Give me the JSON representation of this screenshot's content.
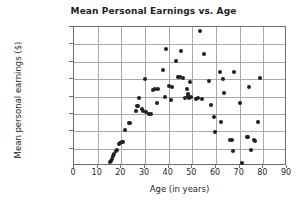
{
  "chart_data": {
    "type": "scatter",
    "title": "Mean Personal Earnings vs. Age",
    "xlabel": "Age (in years)",
    "ylabel": "Mean personal earnings ($)",
    "xlim": [
      0,
      90
    ],
    "ylim": [
      0,
      80000
    ],
    "xticks": [
      0,
      10,
      20,
      30,
      40,
      50,
      60,
      70,
      80,
      90
    ],
    "xtick_labels": [
      "0",
      "10",
      "20",
      "30",
      "40",
      "50",
      "60",
      "70",
      "80",
      "90"
    ],
    "yticks": [
      10000,
      20000,
      30000,
      40000,
      50000,
      60000,
      70000,
      80000
    ],
    "ytick_labels": [
      "10,000",
      "20,000",
      "30,000",
      "40,000",
      "50,000",
      "60,000",
      "70,000",
      "80,000"
    ],
    "grid": true,
    "legend": null,
    "marker_color": "#231f20",
    "gridline_color": "#a7a9ac",
    "axis_color": "#6d6e71",
    "points": [
      [
        15.5,
        1500
      ],
      [
        16.0,
        2200
      ],
      [
        16.5,
        3400
      ],
      [
        17.0,
        5200
      ],
      [
        17.5,
        6500
      ],
      [
        18.0,
        7800
      ],
      [
        18.5,
        8800
      ],
      [
        19.5,
        11800
      ],
      [
        20.0,
        12500
      ],
      [
        20.5,
        13400
      ],
      [
        21.0,
        13200
      ],
      [
        22.0,
        20100
      ],
      [
        23.5,
        24300
      ],
      [
        24.0,
        23900
      ],
      [
        26.5,
        31200
      ],
      [
        27.0,
        33800
      ],
      [
        27.5,
        34200
      ],
      [
        27.8,
        38300
      ],
      [
        29.0,
        32400
      ],
      [
        29.5,
        31300
      ],
      [
        30.5,
        49500
      ],
      [
        31.0,
        30600
      ],
      [
        32.0,
        29200
      ],
      [
        33.0,
        29300
      ],
      [
        34.0,
        43200
      ],
      [
        34.8,
        43600
      ],
      [
        35.5,
        35600
      ],
      [
        36.0,
        44000
      ],
      [
        38.0,
        54400
      ],
      [
        39.0,
        39400
      ],
      [
        39.5,
        66800
      ],
      [
        40.5,
        45200
      ],
      [
        41.5,
        37600
      ],
      [
        42.0,
        44700
      ],
      [
        43.5,
        59600
      ],
      [
        44.5,
        50700
      ],
      [
        45.0,
        50500
      ],
      [
        45.5,
        65700
      ],
      [
        46.5,
        50200
      ],
      [
        47.5,
        38700
      ],
      [
        48.0,
        43800
      ],
      [
        48.5,
        40700
      ],
      [
        48.8,
        39800
      ],
      [
        49.0,
        38500
      ],
      [
        49.5,
        47600
      ],
      [
        50.0,
        38900
      ],
      [
        52.0,
        38200
      ],
      [
        53.0,
        38300
      ],
      [
        53.5,
        77300
      ],
      [
        54.5,
        38000
      ],
      [
        55.5,
        63900
      ],
      [
        57.5,
        48300
      ],
      [
        58.5,
        34800
      ],
      [
        59.5,
        27700
      ],
      [
        60.0,
        19200
      ],
      [
        62.0,
        53400
      ],
      [
        62.5,
        24900
      ],
      [
        63.5,
        49700
      ],
      [
        64.0,
        41200
      ],
      [
        66.5,
        14500
      ],
      [
        67.0,
        14200
      ],
      [
        67.5,
        8000
      ],
      [
        68.0,
        53500
      ],
      [
        70.5,
        35400
      ],
      [
        71.5,
        1000
      ],
      [
        73.5,
        16300
      ],
      [
        74.0,
        15900
      ],
      [
        74.5,
        44700
      ],
      [
        75.0,
        8900
      ],
      [
        76.5,
        14600
      ],
      [
        77.0,
        14000
      ],
      [
        78.0,
        24800
      ],
      [
        79.0,
        50100
      ]
    ]
  }
}
